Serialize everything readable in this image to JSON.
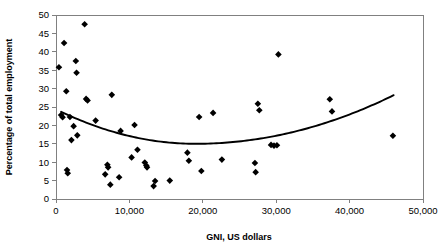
{
  "chart_data": {
    "type": "scatter",
    "title": "",
    "xlabel": "GNI, US dollars",
    "ylabel": "Percentage of total employment",
    "xlim": [
      0,
      50000
    ],
    "ylim": [
      0,
      50
    ],
    "xticks": [
      0,
      10000,
      20000,
      30000,
      40000,
      50000
    ],
    "xtick_labels": [
      "0",
      "10,000",
      "20,000",
      "30,000",
      "40,000",
      "50,000"
    ],
    "yticks": [
      0,
      5,
      10,
      15,
      20,
      25,
      30,
      35,
      40,
      45,
      50
    ],
    "ytick_labels": [
      "0",
      "5",
      "10",
      "15",
      "20",
      "25",
      "30",
      "35",
      "40",
      "45",
      "50"
    ],
    "grid": false,
    "legend": false,
    "marker_shape": "diamond",
    "marker_color": "#000000",
    "series": [
      {
        "name": "Countries",
        "points": [
          [
            400,
            35.8
          ],
          [
            700,
            22.8
          ],
          [
            900,
            22.2
          ],
          [
            1100,
            42.4
          ],
          [
            1400,
            29.3
          ],
          [
            1500,
            7.9
          ],
          [
            1600,
            7.0
          ],
          [
            1900,
            22.3
          ],
          [
            2100,
            16.0
          ],
          [
            2400,
            19.8
          ],
          [
            2700,
            37.5
          ],
          [
            2800,
            34.3
          ],
          [
            2900,
            17.3
          ],
          [
            3900,
            47.5
          ],
          [
            4100,
            27.2
          ],
          [
            4300,
            26.8
          ],
          [
            5400,
            21.3
          ],
          [
            6700,
            6.7
          ],
          [
            7000,
            9.3
          ],
          [
            7100,
            8.6
          ],
          [
            7400,
            3.9
          ],
          [
            7600,
            28.3
          ],
          [
            8600,
            5.9
          ],
          [
            8800,
            18.5
          ],
          [
            10300,
            11.3
          ],
          [
            10700,
            20.1
          ],
          [
            11100,
            13.4
          ],
          [
            12100,
            9.9
          ],
          [
            12300,
            9.1
          ],
          [
            12400,
            8.6
          ],
          [
            13300,
            3.5
          ],
          [
            13500,
            4.9
          ],
          [
            15500,
            5.0
          ],
          [
            17900,
            12.6
          ],
          [
            18100,
            10.4
          ],
          [
            19500,
            22.3
          ],
          [
            19800,
            7.6
          ],
          [
            21400,
            23.4
          ],
          [
            22600,
            10.7
          ],
          [
            27100,
            9.8
          ],
          [
            27200,
            7.3
          ],
          [
            27500,
            25.9
          ],
          [
            27700,
            24.1
          ],
          [
            29300,
            14.7
          ],
          [
            29700,
            14.5
          ],
          [
            30100,
            14.6
          ],
          [
            30300,
            39.3
          ],
          [
            37300,
            27.1
          ],
          [
            37600,
            23.8
          ],
          [
            45900,
            17.2
          ]
        ]
      }
    ],
    "trendline": {
      "type": "quadratic",
      "description": "U-shaped fitted curve, minimum near GNI 19,000 at ~15%",
      "x_start": 700,
      "x_end": 46000,
      "y_start": 23.7,
      "y_min": 15.0,
      "x_min": 19000,
      "y_end": 28.2
    }
  }
}
